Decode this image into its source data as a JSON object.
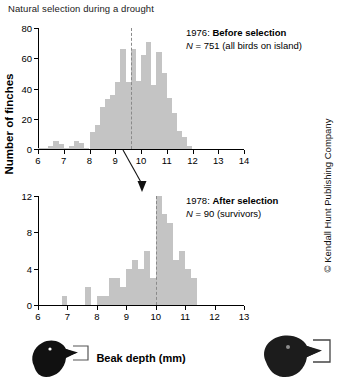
{
  "figure": {
    "title": "Natural selection during a drought",
    "xlabel": "Beak depth (mm)",
    "ylabel": "Number of finches",
    "copyright": "© Kendall Hunt Publishing Company"
  },
  "panels": {
    "before": {
      "year": "1976:",
      "condition": "Before selection",
      "n_symbol": "N",
      "n_text": "= 751 (all birds on island)"
    },
    "after": {
      "year": "1978:",
      "condition": "After selection",
      "n_symbol": "N",
      "n_text": "= 90 (survivors)"
    }
  },
  "icons": {
    "small_finch": "small-finch-head-icon",
    "large_finch": "large-finch-head-icon",
    "caliper": "beak-caliper-bracket-icon",
    "selection_arrow": "downward-arrow-icon"
  },
  "colors": {
    "bar": "#c4c4c4",
    "axis": "#000000",
    "mean_line": "#8a8a8a",
    "text": "#111111"
  },
  "chart_data": [
    {
      "type": "bar",
      "id": "1976-before-selection",
      "title": "1976: Before selection",
      "subtitle": "N = 751 (all birds on island)",
      "xlabel": "Beak depth (mm)",
      "ylabel": "Number of finches",
      "xlim": [
        6,
        14
      ],
      "ylim": [
        0,
        80
      ],
      "yticks": [
        0,
        20,
        40,
        60,
        80
      ],
      "xticks": [
        6,
        7,
        8,
        9,
        10,
        11,
        12,
        13,
        14
      ],
      "bin_width": 0.2,
      "grid": false,
      "mean_line": 9.6,
      "bin_starts": [
        6.0,
        6.2,
        6.4,
        6.6,
        6.8,
        7.0,
        7.2,
        7.4,
        7.6,
        7.8,
        8.0,
        8.2,
        8.4,
        8.6,
        8.8,
        9.0,
        9.2,
        9.4,
        9.6,
        9.8,
        10.0,
        10.2,
        10.4,
        10.6,
        10.8,
        11.0,
        11.2,
        11.4,
        11.6,
        11.8
      ],
      "values": [
        1,
        1,
        2,
        5,
        3,
        1,
        2,
        5,
        4,
        1,
        11,
        16,
        28,
        33,
        36,
        44,
        66,
        44,
        66,
        45,
        62,
        71,
        42,
        64,
        50,
        34,
        24,
        12,
        8,
        2
      ]
    },
    {
      "type": "bar",
      "id": "1978-after-selection",
      "title": "1978: After selection",
      "subtitle": "N = 90 (survivors)",
      "xlabel": "Beak depth (mm)",
      "ylabel": "Number of finches",
      "xlim": [
        6,
        13
      ],
      "ylim": [
        0,
        12
      ],
      "yticks": [
        0,
        4,
        8,
        12
      ],
      "xticks": [
        6,
        7,
        8,
        9,
        10,
        11,
        12,
        13
      ],
      "bin_width": 0.2,
      "grid": false,
      "mean_line": 10.0,
      "bin_starts": [
        6.8,
        7.0,
        7.6,
        7.8,
        8.0,
        8.2,
        8.4,
        8.6,
        8.8,
        9.0,
        9.2,
        9.4,
        9.6,
        9.8,
        10.0,
        10.2,
        10.4,
        10.6,
        10.8,
        11.0,
        11.2
      ],
      "values": [
        1,
        0,
        2,
        0,
        1,
        1,
        3,
        3,
        2,
        4,
        5,
        4,
        6,
        3,
        12,
        10,
        9,
        5,
        6,
        4,
        3
      ]
    }
  ]
}
